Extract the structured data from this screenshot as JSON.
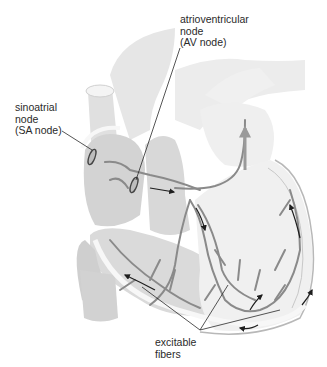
{
  "diagram": {
    "labels": {
      "av_node": {
        "lines": [
          "atrioventricular",
          "node",
          "(AV node)"
        ]
      },
      "sa_node": {
        "lines": [
          "sinoatrial",
          "node",
          "(SA node)"
        ]
      },
      "fibers": {
        "lines": [
          "excitable",
          "fibers"
        ]
      }
    },
    "colors": {
      "background": "#ffffff",
      "tissue_light": "#ececec",
      "tissue_mid": "#d6d6d6",
      "tissue_dark": "#c4c4c4",
      "fiber": "#8a8a8a",
      "leader_line": "#2a2a2a",
      "arrow": "#1e1e1e"
    }
  }
}
